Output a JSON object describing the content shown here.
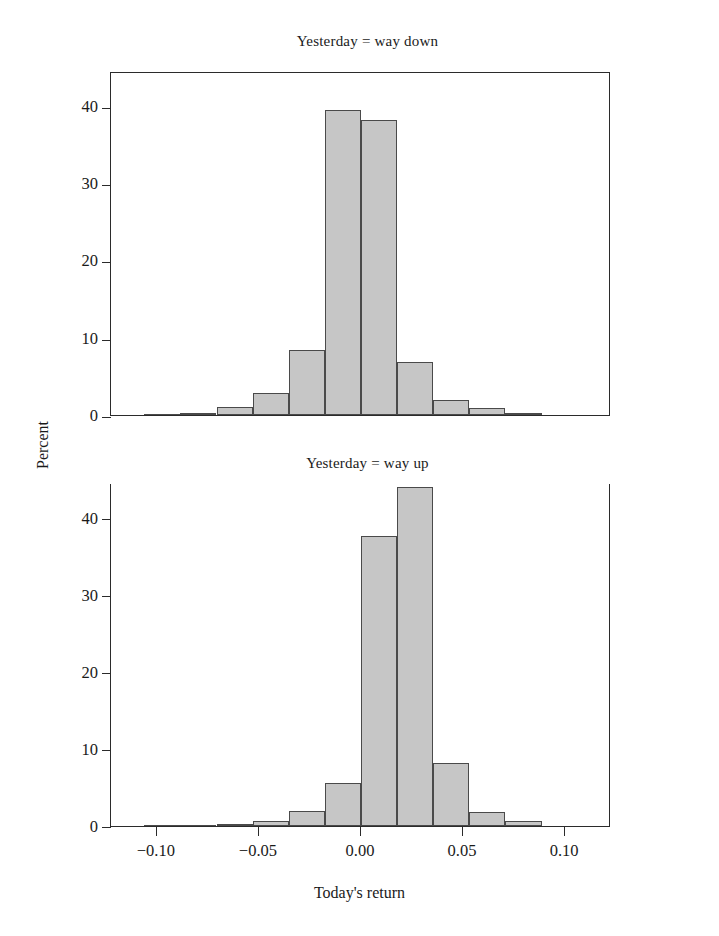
{
  "figure": {
    "xaxis_title": "Today's return",
    "yaxis_title": "Percent"
  },
  "chart_data": [
    {
      "type": "bar",
      "title": "Yesterday = way down",
      "panel": "top",
      "xlabel": "Today's return",
      "ylabel": "Percent",
      "xlim": [
        -0.1225,
        0.1225
      ],
      "ylim": [
        0,
        44.5
      ],
      "xticks": [
        -0.1,
        -0.05,
        0.0,
        0.05,
        0.1
      ],
      "xtick_labels": [
        "-0.10",
        "-0.05",
        "0.00",
        "0.05",
        "0.10"
      ],
      "yticks": [
        0,
        10,
        20,
        30,
        40
      ],
      "ytick_labels": [
        "0",
        "10",
        "20",
        "30",
        "40"
      ],
      "grid": false,
      "legend": "none",
      "bin_width": 0.0177,
      "bin_starts": [
        -0.1062,
        -0.0885,
        -0.0708,
        -0.0531,
        -0.0354,
        -0.0177,
        0.0,
        0.0177,
        0.0354,
        0.0531,
        0.0708
      ],
      "bin_centers": [
        -0.0973,
        -0.0796,
        -0.0619,
        -0.0442,
        -0.0265,
        -0.0088,
        0.0088,
        0.0265,
        0.0442,
        0.0619,
        0.0796
      ],
      "values": [
        0.0,
        0.3,
        1.1,
        2.8,
        8.4,
        39.4,
        38.2,
        6.9,
        1.9,
        0.9,
        0.2
      ],
      "bar_fill": "#c6c6c6",
      "bar_edge": "#4a4a4a"
    },
    {
      "type": "bar",
      "title": "Yesterday = way up",
      "panel": "bottom",
      "xlabel": "Today's return",
      "ylabel": "Percent",
      "xlim": [
        -0.1225,
        0.1225
      ],
      "ylim": [
        0,
        44.5
      ],
      "xticks": [
        -0.1,
        -0.05,
        0.0,
        0.05,
        0.1
      ],
      "xtick_labels": [
        "-0.10",
        "-0.05",
        "0.00",
        "0.05",
        "0.10"
      ],
      "yticks": [
        0,
        10,
        20,
        30,
        40
      ],
      "ytick_labels": [
        "0",
        "10",
        "20",
        "30",
        "40"
      ],
      "grid": false,
      "legend": "none",
      "bin_width": 0.0177,
      "bin_starts": [
        -0.1062,
        -0.0885,
        -0.0708,
        -0.0531,
        -0.0354,
        -0.0177,
        0.0,
        0.0177,
        0.0354,
        0.0531,
        0.0708
      ],
      "bin_centers": [
        -0.0973,
        -0.0796,
        -0.0619,
        -0.0442,
        -0.0265,
        -0.0088,
        0.0088,
        0.0265,
        0.0442,
        0.0619,
        0.0796
      ],
      "values": [
        0.0,
        0.0,
        0.2,
        0.7,
        1.9,
        5.6,
        37.6,
        44.0,
        8.2,
        1.8,
        0.6
      ],
      "bar_fill": "#c6c6c6",
      "bar_edge": "#4a4a4a"
    }
  ]
}
